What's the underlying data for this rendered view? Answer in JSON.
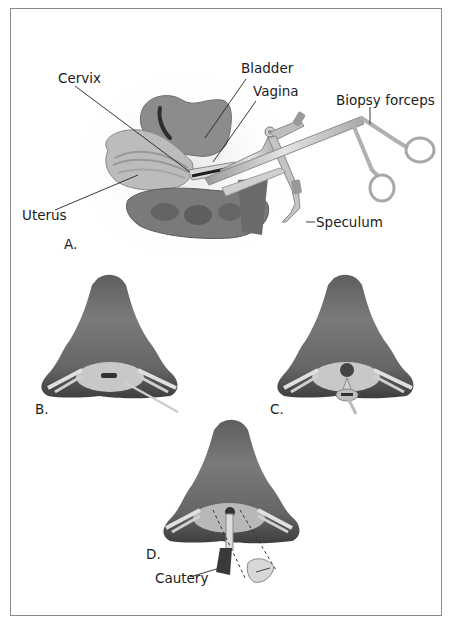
{
  "figure": {
    "panels": [
      {
        "id": "A",
        "label": "A."
      },
      {
        "id": "B",
        "label": "B."
      },
      {
        "id": "C",
        "label": "C."
      },
      {
        "id": "D",
        "label": "D."
      }
    ],
    "labels": {
      "cervix": "Cervix",
      "bladder": "Bladder",
      "vagina": "Vagina",
      "biopsy_forceps": "Biopsy forceps",
      "uterus": "Uterus",
      "speculum": "Speculum",
      "cautery": "Cautery"
    },
    "colors": {
      "frame_border": "#8a8a8a",
      "tissue_dark": "#5a5a5a",
      "tissue_mid": "#7c7c7c",
      "tissue_light": "#bdbdbd",
      "instrument": "#c8c8c8",
      "text": "#1c1c1c"
    }
  }
}
